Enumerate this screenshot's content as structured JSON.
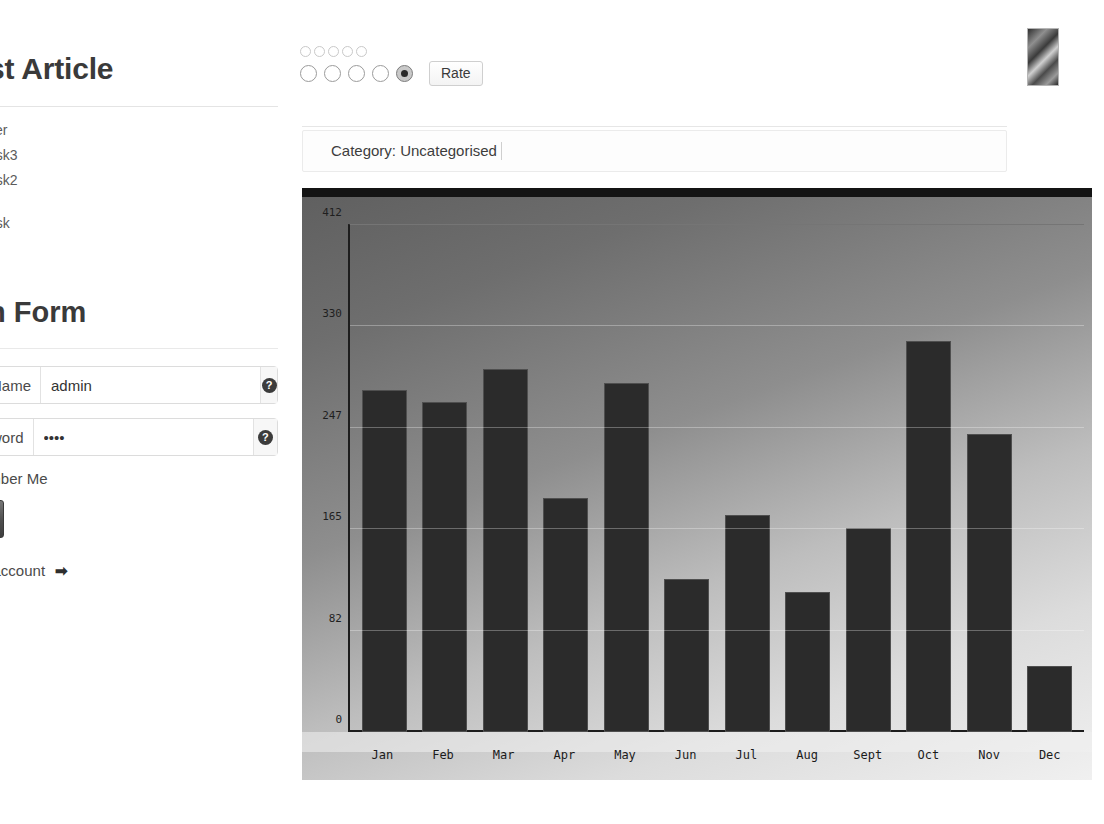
{
  "article": {
    "title": "st Article",
    "tasks": [
      "ker",
      "ask3",
      "ask2",
      "ask"
    ]
  },
  "rating": {
    "mini_circle_count": 5,
    "options": [
      {
        "value": "1",
        "checked": false
      },
      {
        "value": "2",
        "checked": false
      },
      {
        "value": "3",
        "checked": false
      },
      {
        "value": "4",
        "checked": false
      },
      {
        "value": "5",
        "checked": true
      }
    ],
    "rate_button_label": "Rate"
  },
  "category": {
    "text": "Category: Uncategorised"
  },
  "login_form": {
    "title": "n Form",
    "name_label": "Name",
    "name_value": "admin",
    "name_help_glyph": "?",
    "password_label": "word",
    "password_value": "••••",
    "password_help_glyph": "?",
    "remember_label": "ember Me",
    "submit_label": "",
    "create_account_label": "n account",
    "arrow_glyph": "➡"
  },
  "chart_data": {
    "type": "bar",
    "title": "",
    "xlabel": "",
    "ylabel": "",
    "categories": [
      "Jan",
      "Feb",
      "Mar",
      "Apr",
      "May",
      "Jun",
      "Jul",
      "Aug",
      "Sept",
      "Oct",
      "Nov",
      "Dec"
    ],
    "values": [
      278,
      268,
      295,
      190,
      284,
      124,
      176,
      114,
      166,
      318,
      242,
      54
    ],
    "yticks": [
      0,
      82,
      165,
      247,
      330,
      412
    ],
    "ylim": [
      0,
      412
    ],
    "grid": true,
    "legend": false,
    "bar_color": "#2b2b2b",
    "background_gradient_from": "#5f5f5f",
    "background_gradient_to": "#f0f0f0"
  }
}
